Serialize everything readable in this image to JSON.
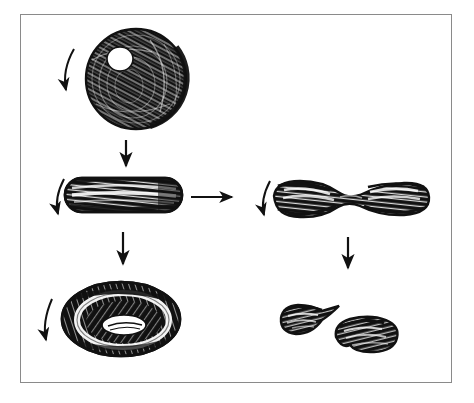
{
  "figure": {
    "background_color": "#ffffff",
    "ink_color": "#111111",
    "frame_border_color": "#8a8a8a",
    "frame": {
      "x": 20,
      "y": 14,
      "width": 432,
      "height": 369
    },
    "canvas": {
      "width": 474,
      "height": 403
    },
    "style": "pen-and-ink hatched line drawing, no text labels"
  },
  "shapes": [
    {
      "id": "sphere",
      "name": "sphere-cell",
      "description": "Dense cross-hatched sphere with white oval highlight in upper-left quadrant",
      "row": 1,
      "column": "left",
      "bbox": {
        "x": 86,
        "y": 29,
        "width": 100,
        "height": 100
      },
      "center": {
        "x": 136,
        "y": 79
      },
      "highlight": {
        "x": 108,
        "y": 48,
        "width": 26,
        "height": 24
      },
      "fill": "#111111",
      "texture": "swirling-hatch"
    },
    {
      "id": "rod",
      "name": "rod-cell",
      "description": "Elongated horizontal capsule / rod with pale hatched band through its length",
      "row": 2,
      "column": "left",
      "bbox": {
        "x": 65,
        "y": 178,
        "width": 117,
        "height": 34
      },
      "center": {
        "x": 123,
        "y": 195
      },
      "fill": "#111111",
      "texture": "longitudinal-hatch"
    },
    {
      "id": "dumbbell",
      "name": "dumbbell-cell",
      "description": "Dumbbell / hourglass form pinched at the midpoint with bulbous ends",
      "row": 2,
      "column": "right",
      "bbox": {
        "x": 272,
        "y": 180,
        "width": 158,
        "height": 38
      },
      "center": {
        "x": 351,
        "y": 199
      },
      "waist_width": 10,
      "fill": "#111111",
      "texture": "longitudinal-hatch"
    },
    {
      "id": "torus",
      "name": "torus-biconcave-disc",
      "description": "Torus / biconcave disc seen obliquely, dark rim with white annular groove and a shaded central depression",
      "row": 3,
      "column": "left",
      "bbox": {
        "x": 62,
        "y": 282,
        "width": 119,
        "height": 74
      },
      "center": {
        "x": 121,
        "y": 319
      },
      "inner_hole": {
        "x": 103,
        "y": 313,
        "width": 42,
        "height": 22
      },
      "fill": "#111111",
      "texture": "radial-hatch"
    },
    {
      "id": "fragment-left",
      "name": "fragment-teardrop",
      "description": "Teardrop shaped fragment pointing to the upper right",
      "row": 3,
      "column": "right",
      "bbox": {
        "x": 277,
        "y": 305,
        "width": 62,
        "height": 32
      },
      "center": {
        "x": 306,
        "y": 320
      },
      "fill": "#111111",
      "texture": "contour-hatch"
    },
    {
      "id": "fragment-right",
      "name": "fragment-kidney",
      "description": "Kidney / comma shaped fragment lying lower-right of the teardrop",
      "row": 3,
      "column": "right",
      "bbox": {
        "x": 333,
        "y": 318,
        "width": 65,
        "height": 35
      },
      "center": {
        "x": 365,
        "y": 335
      },
      "fill": "#111111",
      "texture": "contour-hatch"
    }
  ],
  "arrows": [
    {
      "id": "arrow-curve-sphere",
      "name": "rotation-arrow-sphere",
      "type": "curved",
      "direction": "down-left",
      "from": {
        "x": 72,
        "y": 50
      },
      "to": {
        "x": 65,
        "y": 96
      },
      "description": "Curved arrow at the left of the sphere indicating rotation / flow direction"
    },
    {
      "id": "arrow-sphere-to-rod",
      "name": "transition-arrow-sphere-to-rod",
      "type": "straight",
      "direction": "down",
      "from": {
        "x": 126,
        "y": 140
      },
      "to": {
        "x": 126,
        "y": 172
      },
      "description": "Vertical arrow from sphere down to the rod"
    },
    {
      "id": "arrow-curve-rod",
      "name": "rotation-arrow-rod",
      "type": "curved",
      "direction": "down-left",
      "from": {
        "x": 62,
        "y": 180
      },
      "to": {
        "x": 57,
        "y": 218
      },
      "description": "Curved arrow at the left of the rod"
    },
    {
      "id": "arrow-rod-to-dumbbell",
      "name": "transition-arrow-rod-to-dumbbell",
      "type": "straight",
      "direction": "right",
      "from": {
        "x": 190,
        "y": 197
      },
      "to": {
        "x": 236,
        "y": 197
      },
      "description": "Horizontal arrow from the rod across to the dumbbell"
    },
    {
      "id": "arrow-curve-dumbbell",
      "name": "rotation-arrow-dumbbell",
      "type": "curved",
      "direction": "down-left",
      "from": {
        "x": 268,
        "y": 182
      },
      "to": {
        "x": 263,
        "y": 219
      },
      "description": "Curved arrow at the left of the dumbbell"
    },
    {
      "id": "arrow-rod-to-torus",
      "name": "transition-arrow-rod-to-torus",
      "type": "straight",
      "direction": "down",
      "from": {
        "x": 123,
        "y": 232
      },
      "to": {
        "x": 123,
        "y": 270
      },
      "description": "Vertical arrow from the rod down to the torus"
    },
    {
      "id": "arrow-dumbbell-to-fragments",
      "name": "transition-arrow-dumbbell-to-fragments",
      "type": "straight",
      "direction": "down",
      "from": {
        "x": 348,
        "y": 237
      },
      "to": {
        "x": 348,
        "y": 274
      },
      "description": "Vertical arrow from the dumbbell down to the pair of fragments"
    },
    {
      "id": "arrow-curve-torus",
      "name": "rotation-arrow-torus",
      "type": "curved",
      "direction": "down-left",
      "from": {
        "x": 50,
        "y": 300
      },
      "to": {
        "x": 44,
        "y": 344
      },
      "description": "Curved arrow at the left of the torus"
    }
  ]
}
